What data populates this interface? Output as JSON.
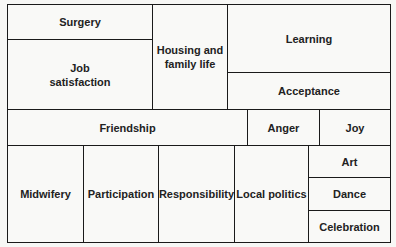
{
  "diagram": {
    "cells": [
      {
        "label": "Surgery"
      },
      {
        "label": "Job satisfaction"
      },
      {
        "label": "Housing and family life"
      },
      {
        "label": "Learning"
      },
      {
        "label": "Acceptance"
      },
      {
        "label": "Friendship"
      },
      {
        "label": "Anger"
      },
      {
        "label": "Joy"
      },
      {
        "label": "Midwifery"
      },
      {
        "label": "Participation"
      },
      {
        "label": "Responsibility"
      },
      {
        "label": "Local politics"
      },
      {
        "label": "Art"
      },
      {
        "label": "Dance"
      },
      {
        "label": "Celebration"
      }
    ]
  }
}
